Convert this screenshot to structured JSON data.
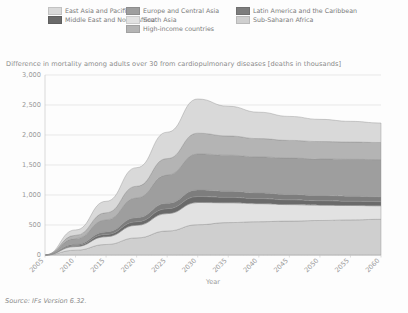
{
  "legend": {
    "rows": [
      [
        {
          "label": "East Asia and Pacific",
          "color": "#d9d9d9",
          "name": "east-asia-and-pacific"
        },
        {
          "label": "Europe and Central Asia",
          "color": "#9e9e9e",
          "name": "europe-and-central-asia"
        },
        {
          "label": "Latin America and the Caribbean",
          "color": "#7d7d7d",
          "name": "latin-america-and-the-caribbean"
        }
      ],
      [
        {
          "label": "Middle East and North Africa",
          "color": "#6a6a6a",
          "name": "middle-east-and-north-africa"
        },
        {
          "label": "South Asia",
          "color": "#e2e2e2",
          "name": "south-asia"
        },
        {
          "label": "Sub-Saharan Africa",
          "color": "#cfcfcf",
          "name": "sub-saharan-africa"
        }
      ],
      [
        {
          "label": "",
          "color": "",
          "name": "spacer"
        },
        {
          "label": "High-income countries",
          "color": "#b4b4b4",
          "name": "high-income-countries"
        },
        {
          "label": "",
          "color": "",
          "name": "spacer"
        }
      ]
    ]
  },
  "chart_data": {
    "type": "area",
    "stacked": true,
    "title": "Difference in mortality among adults over 30 from cardiopulmonary diseases [deaths in thousands]",
    "xlabel": "Year",
    "ylabel": "",
    "xlim": [
      2005,
      2060
    ],
    "ylim": [
      0,
      3000
    ],
    "grid": true,
    "legend_position": "top",
    "x": [
      2005,
      2010,
      2015,
      2020,
      2025,
      2030,
      2035,
      2040,
      2045,
      2050,
      2055,
      2060
    ],
    "xticklabels": [
      "2005",
      "2010",
      "2015",
      "2020",
      "2025",
      "2030",
      "2035",
      "2040",
      "2045",
      "2050",
      "2055",
      "2060"
    ],
    "yticks": [
      0,
      500,
      1000,
      1500,
      2000,
      2500,
      3000
    ],
    "yticklabels": [
      "0",
      "500",
      "1,000",
      "1,500",
      "2,000",
      "2,500",
      "3,000"
    ],
    "series": [
      {
        "name": "Sub-Saharan Africa",
        "color": "#cfcfcf",
        "values": [
          0,
          80,
          175,
          285,
          400,
          505,
          540,
          555,
          565,
          575,
          585,
          595
        ]
      },
      {
        "name": "South Asia",
        "color": "#e2e2e2",
        "values": [
          0,
          60,
          130,
          210,
          290,
          370,
          330,
          300,
          275,
          255,
          240,
          225
        ]
      },
      {
        "name": "Middle East and North Africa",
        "color": "#6a6a6a",
        "values": [
          0,
          18,
          38,
          60,
          82,
          100,
          92,
          85,
          80,
          75,
          72,
          70
        ]
      },
      {
        "name": "Latin America and the Caribbean",
        "color": "#7d7d7d",
        "values": [
          0,
          20,
          42,
          66,
          90,
          110,
          102,
          95,
          90,
          86,
          83,
          80
        ]
      },
      {
        "name": "Europe and Central Asia",
        "color": "#9e9e9e",
        "values": [
          0,
          95,
          200,
          330,
          470,
          600,
          600,
          600,
          605,
          610,
          615,
          620
        ]
      },
      {
        "name": "High-income countries",
        "color": "#b4b4b4",
        "values": [
          0,
          55,
          120,
          195,
          275,
          345,
          320,
          305,
          295,
          290,
          288,
          285
        ]
      },
      {
        "name": "East Asia and Pacific",
        "color": "#d9d9d9",
        "values": [
          0,
          90,
          190,
          310,
          440,
          570,
          495,
          440,
          400,
          370,
          345,
          325
        ]
      }
    ],
    "totals": [
      0,
      418,
      895,
      1456,
      2047,
      2600,
      2479,
      2380,
      2310,
      2261,
      2228,
      2200
    ]
  },
  "source": "Source: IFs Version 6.32."
}
